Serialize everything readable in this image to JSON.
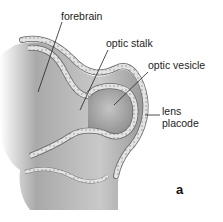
{
  "figure": {
    "panel_label": "a",
    "labels": {
      "forebrain": "forebrain",
      "optic_stalk": "optic stalk",
      "optic_vesicle": "optic vesicle",
      "lens_line1": "lens",
      "lens_line2": "placode"
    }
  },
  "colors": {
    "background": "#ffffff",
    "tissue_dark": "#8a8a8a",
    "tissue_mid": "#b5b5b5",
    "tissue_light": "#e2e2e2",
    "epithelium": "#d9d9d9",
    "outline": "#555555",
    "text": "#222222"
  }
}
